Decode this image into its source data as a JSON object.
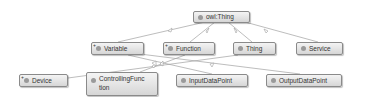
{
  "diagram": {
    "type": "class-hierarchy",
    "nodes": [
      {
        "id": "owl_thing",
        "label": "owl:Thing",
        "expandable": false
      },
      {
        "id": "variable",
        "label": "Variable",
        "expandable": true
      },
      {
        "id": "function",
        "label": "Function",
        "expandable": true
      },
      {
        "id": "thing",
        "label": "Thing",
        "expandable": false
      },
      {
        "id": "service",
        "label": "Service",
        "expandable": false
      },
      {
        "id": "device",
        "label": "Device",
        "expandable": true
      },
      {
        "id": "controlling_function",
        "label_line1": "ControllingFunc",
        "label_line2": "tion",
        "label": "ControllingFunction",
        "expandable": false
      },
      {
        "id": "input_data_point",
        "label": "InputDataPoint",
        "expandable": false
      },
      {
        "id": "output_data_point",
        "label": "OutputDataPoint",
        "expandable": false
      }
    ],
    "edges": [
      {
        "from": "variable",
        "to": "owl_thing"
      },
      {
        "from": "function",
        "to": "owl_thing"
      },
      {
        "from": "thing",
        "to": "owl_thing"
      },
      {
        "from": "service",
        "to": "owl_thing"
      },
      {
        "from": "device",
        "to": "thing"
      },
      {
        "from": "controlling_function",
        "to": "function"
      },
      {
        "from": "input_data_point",
        "to": "variable"
      },
      {
        "from": "output_data_point",
        "to": "variable"
      }
    ],
    "expand_marker": "+",
    "colors": {
      "node_fill_top": "#f4f4f4",
      "node_fill_bottom": "#d6d6d6",
      "node_border": "#8a8a8a",
      "edge": "#9a9a9a",
      "dot": "#9a9a9a"
    }
  }
}
